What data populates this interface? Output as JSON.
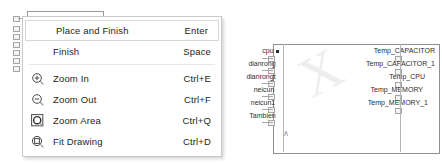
{
  "context_menu": {
    "groups": [
      {
        "items": [
          {
            "icon": "",
            "label": "Place and Finish",
            "shortcut": "Enter",
            "highlighted": true
          },
          {
            "icon": "",
            "label": "Finish",
            "shortcut": "Space",
            "highlighted": false
          }
        ]
      },
      {
        "items": [
          {
            "icon": "zoom-in-icon",
            "label": "Zoom In",
            "shortcut": "Ctrl+E",
            "highlighted": false
          },
          {
            "icon": "zoom-out-icon",
            "label": "Zoom Out",
            "shortcut": "Ctrl+F",
            "highlighted": false
          },
          {
            "icon": "zoom-area-icon",
            "label": "Zoom Area",
            "shortcut": "Ctrl+Q",
            "highlighted": false
          },
          {
            "icon": "fit-drawing-icon",
            "label": "Fit Drawing",
            "shortcut": "Ctrl+D",
            "highlighted": false
          }
        ]
      }
    ]
  },
  "diagram": {
    "watermark": "X",
    "input_ports": [
      {
        "label": "cpu"
      },
      {
        "label": "dianrong"
      },
      {
        "label": "dianrongt"
      },
      {
        "label": "neicun"
      },
      {
        "label": "neicun1"
      },
      {
        "label": "Tambien"
      }
    ],
    "output_ports": [
      {
        "label": "Temp_CAPACITOR"
      },
      {
        "label": "Temp_CAPACITOR_1"
      },
      {
        "label": "Temp_CPU"
      },
      {
        "label": "Temp_MEMORY"
      },
      {
        "label": "Temp_MEMORY_1"
      }
    ]
  },
  "colors": {
    "menu_background": "#ffffff",
    "menu_border": "#c9c9c9",
    "text": "#231f20",
    "separator": "#e6e6e6",
    "block_outline": "#9a9a9a",
    "port_outline": "#a5a5a5"
  }
}
